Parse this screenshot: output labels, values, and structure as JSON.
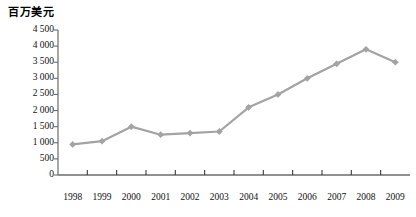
{
  "chart_data": {
    "type": "line",
    "title": "百万美元",
    "xlabel": "",
    "ylabel": "百万美元",
    "categories": [
      "1998",
      "1999",
      "2000",
      "2001",
      "2002",
      "2003",
      "2004",
      "2005",
      "2006",
      "2007",
      "2008",
      "2009"
    ],
    "values": [
      950,
      1050,
      1500,
      1250,
      1300,
      1350,
      2100,
      2500,
      3000,
      3450,
      3900,
      3500
    ],
    "series": [
      {
        "name": "",
        "values": [
          950,
          1050,
          1500,
          1250,
          1300,
          1350,
          2100,
          2500,
          3000,
          3450,
          3900,
          3500
        ]
      }
    ],
    "ylim": [
      0,
      4500
    ],
    "yticks": [
      0,
      500,
      1000,
      1500,
      2000,
      2500,
      3000,
      3500,
      4000,
      4500
    ],
    "ytick_labels": [
      "0",
      "500",
      "1 000",
      "1 500",
      "2 000",
      "2 500",
      "3 000",
      "3 500",
      "4 000",
      "4 500"
    ],
    "grid": false,
    "legend": "none",
    "line_color": "#a3a3a3",
    "marker_color": "#a3a3a3",
    "marker_shape": "diamond",
    "axis_color": "#6b6b6b",
    "text_color": "#111111",
    "background": "#ffffff"
  }
}
